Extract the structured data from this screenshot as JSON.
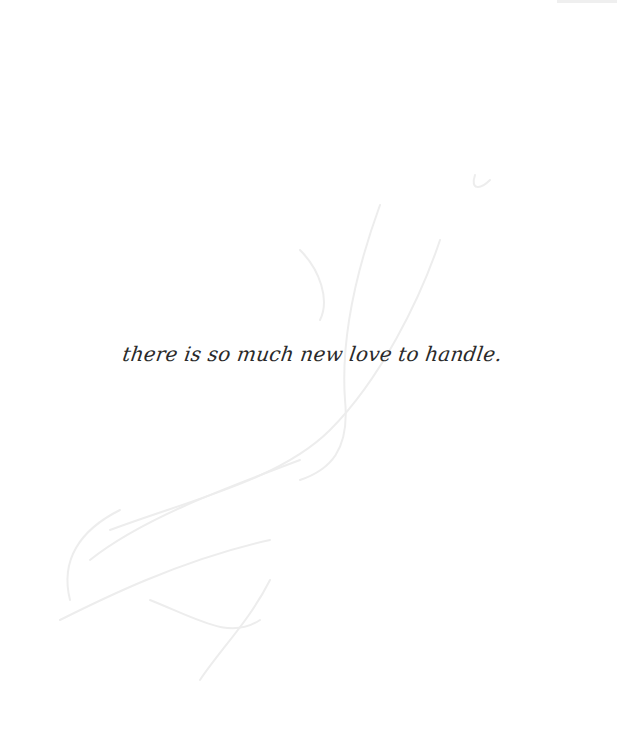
{
  "page": {
    "text_line": "there is so much new love to handle.",
    "colors": {
      "background": "#ffffff",
      "text": "#2a2a2a",
      "bleed_through": "#ececec"
    }
  }
}
